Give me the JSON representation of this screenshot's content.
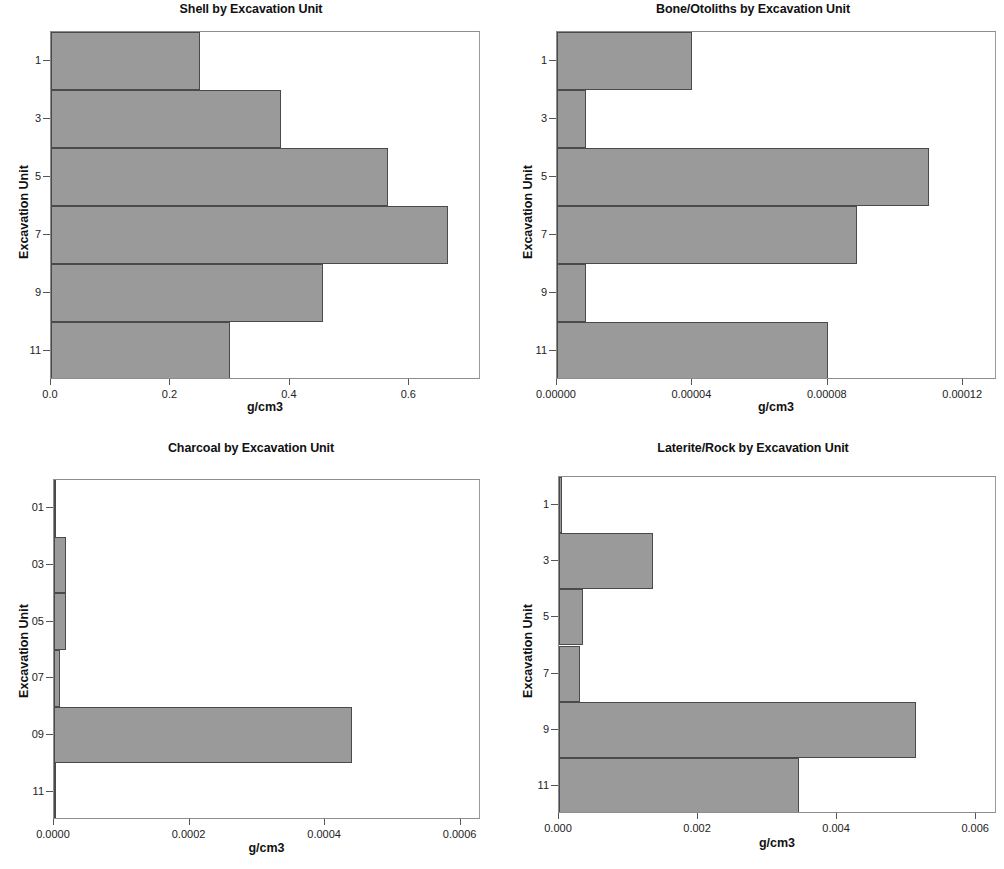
{
  "figure": {
    "panel_count": 4,
    "bar_fill_color": "#9a9a9a",
    "bar_edge_color": "#4a4a4a",
    "frame_color": "#8d8d8d",
    "background_color": "#ffffff"
  },
  "chart_data": [
    {
      "type": "bar",
      "orientation": "horizontal",
      "title": "Shell by Excavation Unit",
      "xlabel": "g/cm3",
      "ylabel": "Excavation Unit",
      "categories": [
        "1",
        "3",
        "5",
        "7",
        "9",
        "11"
      ],
      "values": [
        0.25,
        0.385,
        0.565,
        0.665,
        0.455,
        0.3
      ],
      "xticks": [
        0.0,
        0.2,
        0.4,
        0.6
      ],
      "xticklabels": [
        "0.0",
        "0.2",
        "0.4",
        "0.6"
      ],
      "yticklabels": [
        "1",
        "3",
        "5",
        "7",
        "9",
        "11"
      ],
      "xlim": [
        0.0,
        0.72
      ],
      "ylim": [
        0,
        6
      ],
      "grid": false,
      "legend": false
    },
    {
      "type": "bar",
      "orientation": "horizontal",
      "title": "Bone/Otoliths by Excavation Unit",
      "xlabel": "g/cm3",
      "ylabel": "Excavation Unit",
      "categories": [
        "1",
        "3",
        "5",
        "7",
        "9",
        "11"
      ],
      "values": [
        4e-05,
        8.5e-06,
        0.00011,
        8.85e-05,
        8.5e-06,
        8e-05
      ],
      "xticks": [
        0.0,
        4e-05,
        8e-05,
        0.00012
      ],
      "xticklabels": [
        "0.00000",
        "0.00004",
        "0.00008",
        "0.00012"
      ],
      "yticklabels": [
        "1",
        "3",
        "5",
        "7",
        "9",
        "11"
      ],
      "xlim": [
        0.0,
        0.00013
      ],
      "ylim": [
        0,
        6
      ],
      "grid": false,
      "legend": false
    },
    {
      "type": "bar",
      "orientation": "horizontal",
      "title": "Charcoal by Excavation Unit",
      "xlabel": "g/cm3",
      "ylabel": "Excavation Unit",
      "categories": [
        "01",
        "03",
        "05",
        "07",
        "09",
        "11"
      ],
      "values": [
        5e-07,
        1.8e-05,
        1.8e-05,
        9.5e-06,
        0.00044,
        5e-07
      ],
      "xticks": [
        0.0,
        0.0002,
        0.0004,
        0.0006
      ],
      "xticklabels": [
        "0.0000",
        "0.0002",
        "0.0004",
        "0.0006"
      ],
      "yticklabels": [
        "01",
        "03",
        "05",
        "07",
        "09",
        "11"
      ],
      "xlim": [
        0.0,
        0.00063
      ],
      "ylim": [
        0,
        6
      ],
      "grid": false,
      "legend": false
    },
    {
      "type": "bar",
      "orientation": "horizontal",
      "title": "Laterite/Rock by Excavation Unit",
      "xlabel": "g/cm3",
      "ylabel": "Excavation Unit",
      "categories": [
        "1",
        "3",
        "5",
        "7",
        "9",
        "11"
      ],
      "values": [
        5e-05,
        0.00135,
        0.00035,
        0.0003,
        0.00513,
        0.00345
      ],
      "xticks": [
        0.0,
        0.002,
        0.004,
        0.006
      ],
      "xticklabels": [
        "0.000",
        "0.002",
        "0.004",
        "0.006"
      ],
      "yticklabels": [
        "1",
        "3",
        "5",
        "7",
        "9",
        "11"
      ],
      "xlim": [
        0.0,
        0.0063
      ],
      "ylim": [
        0,
        6
      ],
      "grid": false,
      "legend": false
    }
  ]
}
